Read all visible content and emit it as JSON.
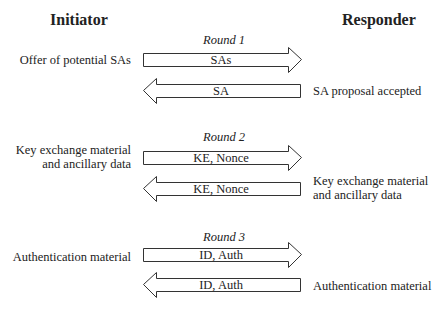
{
  "headings": {
    "initiator": "Initiator",
    "responder": "Responder"
  },
  "rounds": [
    {
      "title": "Round 1",
      "initiator_label": [
        "Offer of potential SAs"
      ],
      "forward_message": "SAs",
      "backward_message": "SA",
      "responder_label": [
        "SA proposal accepted"
      ]
    },
    {
      "title": "Round 2",
      "initiator_label": [
        "Key exchange material",
        "and ancillary data"
      ],
      "forward_message": "KE, Nonce",
      "backward_message": "KE, Nonce",
      "responder_label": [
        "Key exchange material",
        "and ancillary data"
      ]
    },
    {
      "title": "Round 3",
      "initiator_label": [
        "Authentication material"
      ],
      "forward_message": "ID, Auth",
      "backward_message": "ID, Auth",
      "responder_label": [
        "Authentication material"
      ]
    }
  ],
  "colors": {
    "stroke": "#333333",
    "text": "#222222",
    "background": "#ffffff"
  }
}
